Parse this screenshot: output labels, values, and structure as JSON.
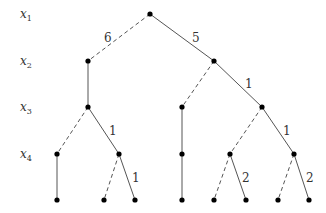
{
  "diagram": {
    "type": "binary-decision-tree",
    "levels": [
      {
        "var": "x",
        "sub": "1",
        "y": 14
      },
      {
        "var": "x",
        "sub": "2",
        "y": 61
      },
      {
        "var": "x",
        "sub": "3",
        "y": 107
      },
      {
        "var": "x",
        "sub": "4",
        "y": 154
      }
    ],
    "nodes": [
      {
        "id": "r",
        "x": 150,
        "y": 14
      },
      {
        "id": "a",
        "x": 88,
        "y": 61
      },
      {
        "id": "b",
        "x": 214,
        "y": 61
      },
      {
        "id": "a1",
        "x": 88,
        "y": 107
      },
      {
        "id": "b0",
        "x": 182,
        "y": 107
      },
      {
        "id": "b1",
        "x": 262,
        "y": 107
      },
      {
        "id": "a10",
        "x": 57,
        "y": 154
      },
      {
        "id": "a11",
        "x": 119,
        "y": 154
      },
      {
        "id": "b00",
        "x": 182,
        "y": 154
      },
      {
        "id": "b10",
        "x": 230,
        "y": 154
      },
      {
        "id": "b11",
        "x": 294,
        "y": 154
      },
      {
        "id": "l1",
        "x": 57,
        "y": 200
      },
      {
        "id": "l2",
        "x": 104,
        "y": 200
      },
      {
        "id": "l3",
        "x": 135,
        "y": 200
      },
      {
        "id": "l4",
        "x": 182,
        "y": 200
      },
      {
        "id": "l5",
        "x": 214,
        "y": 200
      },
      {
        "id": "l6",
        "x": 246,
        "y": 200
      },
      {
        "id": "l7",
        "x": 278,
        "y": 200
      },
      {
        "id": "l8",
        "x": 309,
        "y": 200
      }
    ],
    "edges": [
      {
        "from": "r",
        "to": "a",
        "style": "dashed",
        "label": "6",
        "lx": 104,
        "ly": 42
      },
      {
        "from": "r",
        "to": "b",
        "style": "solid",
        "label": "5",
        "lx": 192,
        "ly": 42
      },
      {
        "from": "a",
        "to": "a1",
        "style": "solid",
        "label": ""
      },
      {
        "from": "b",
        "to": "b0",
        "style": "dashed",
        "label": ""
      },
      {
        "from": "b",
        "to": "b1",
        "style": "solid",
        "label": "1",
        "lx": 245,
        "ly": 88
      },
      {
        "from": "a1",
        "to": "a10",
        "style": "dashed",
        "label": ""
      },
      {
        "from": "a1",
        "to": "a11",
        "style": "solid",
        "label": "1",
        "lx": 109,
        "ly": 135
      },
      {
        "from": "b0",
        "to": "b00",
        "style": "solid",
        "label": ""
      },
      {
        "from": "b1",
        "to": "b10",
        "style": "dashed",
        "label": ""
      },
      {
        "from": "b1",
        "to": "b11",
        "style": "solid",
        "label": "1",
        "lx": 283,
        "ly": 135
      },
      {
        "from": "a10",
        "to": "l1",
        "style": "solid",
        "label": ""
      },
      {
        "from": "a11",
        "to": "l2",
        "style": "dashed",
        "label": ""
      },
      {
        "from": "a11",
        "to": "l3",
        "style": "solid",
        "label": "1",
        "lx": 132,
        "ly": 182
      },
      {
        "from": "b00",
        "to": "l4",
        "style": "solid",
        "label": ""
      },
      {
        "from": "b10",
        "to": "l5",
        "style": "dashed",
        "label": ""
      },
      {
        "from": "b10",
        "to": "l6",
        "style": "solid",
        "label": "2",
        "lx": 242,
        "ly": 182
      },
      {
        "from": "b11",
        "to": "l7",
        "style": "dashed",
        "label": ""
      },
      {
        "from": "b11",
        "to": "l8",
        "style": "solid",
        "label": "2",
        "lx": 306,
        "ly": 182
      }
    ]
  }
}
